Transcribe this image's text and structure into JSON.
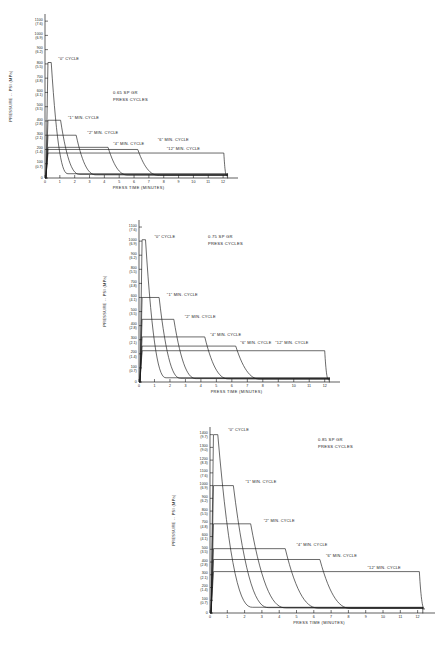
{
  "document": {
    "kind": "engineering-chart-sheet",
    "figure_count": 3
  },
  "shared": {
    "xlabel": "PRESS TIME (MINUTES)",
    "ylabel": "PRESSURE -- PSI (MPa)",
    "x_ticks": [
      "0",
      "1",
      "2",
      "3",
      "4",
      "5",
      "6",
      "7",
      "8",
      "9",
      "10",
      "11",
      "12"
    ],
    "curve_label_0": "\"0\" CYCLE",
    "curve_label_1": "\"1\" MIN. CYCLE",
    "curve_label_2": "\"2\" MIN. CYCLE",
    "curve_label_4": "\"4\" MIN. CYCLE",
    "curve_label_6": "\"6\" MIN. CYCLE",
    "curve_label_12": "\"12\" MIN. CYCLE",
    "ink_color": "#1a1a1a",
    "background_color": "#ffffff"
  },
  "chart_data": [
    {
      "id": "chart-065",
      "type": "line",
      "title": "0.65 SP GR",
      "subtitle": "PRESS CYCLES",
      "xlabel": "PRESS TIME (MINUTES)",
      "ylabel": "PRESSURE -- PSI (MPa)",
      "xlim": [
        0,
        12.6
      ],
      "ylim": [
        0,
        1150
      ],
      "grid": false,
      "legend": "inline-annotations",
      "y_ticks": [
        {
          "psi": 1100,
          "mpa": "7.6"
        },
        {
          "psi": 1000,
          "mpa": "6.9"
        },
        {
          "psi": 900,
          "mpa": "6.2"
        },
        {
          "psi": 800,
          "mpa": "5.5"
        },
        {
          "psi": 700,
          "mpa": "4.8"
        },
        {
          "psi": 600,
          "mpa": "4.1"
        },
        {
          "psi": 500,
          "mpa": "3.5"
        },
        {
          "psi": 400,
          "mpa": "2.8"
        },
        {
          "psi": 300,
          "mpa": "2.1"
        },
        {
          "psi": 200,
          "mpa": "1.4"
        },
        {
          "psi": 100,
          "mpa": "0.7"
        },
        {
          "psi": 0,
          "mpa": ""
        }
      ],
      "x_ticks": [
        0,
        1,
        2,
        3,
        4,
        5,
        6,
        7,
        8,
        9,
        10,
        11,
        12
      ],
      "series": [
        {
          "name": "\"0\" CYCLE",
          "peak_psi": 810,
          "plateau_psi": 810,
          "plateau_end_min": 0.42,
          "decay_end_min": 1.55,
          "tail_psi": 30
        },
        {
          "name": "\"1\" MIN. CYCLE",
          "peak_psi": 405,
          "plateau_psi": 405,
          "plateau_end_min": 1.05,
          "decay_end_min": 2.35,
          "tail_psi": 25
        },
        {
          "name": "\"2\" MIN. CYCLE",
          "peak_psi": 300,
          "plateau_psi": 300,
          "plateau_end_min": 2.1,
          "decay_end_min": 3.45,
          "tail_psi": 22
        },
        {
          "name": "\"4\" MIN. CYCLE",
          "peak_psi": 215,
          "plateau_psi": 215,
          "plateau_end_min": 4.25,
          "decay_end_min": 5.6,
          "tail_psi": 20
        },
        {
          "name": "\"6\" MIN. CYCLE",
          "peak_psi": 200,
          "plateau_psi": 200,
          "plateau_end_min": 6.25,
          "decay_end_min": 7.7,
          "tail_psi": 18
        },
        {
          "name": "\"12\" MIN. CYCLE",
          "peak_psi": 175,
          "plateau_psi": 175,
          "plateau_end_min": 12.05,
          "decay_end_min": 12.25,
          "tail_psi": 15
        }
      ],
      "annotations": [
        {
          "text": "\"0\" CYCLE",
          "x_min": 0.9,
          "psi": 830
        },
        {
          "text": "\"1\" MIN. CYCLE",
          "x_min": 1.55,
          "psi": 415
        },
        {
          "text": "\"2\" MIN. CYCLE",
          "x_min": 2.85,
          "psi": 310
        },
        {
          "text": "\"4\" MIN. CYCLE",
          "x_min": 4.6,
          "psi": 228
        },
        {
          "text": "\"6\" MIN. CYCLE",
          "x_min": 7.6,
          "psi": 258
        },
        {
          "text": "\"12\" MIN. CYCLE",
          "x_min": 8.2,
          "psi": 195
        }
      ]
    },
    {
      "id": "chart-075",
      "type": "line",
      "title": "0.75 SP GR",
      "subtitle": "PRESS CYCLES",
      "xlabel": "PRESS TIME (MINUTES)",
      "ylabel": "PRESSURE -- PSI (MPa)",
      "xlim": [
        0,
        12.6
      ],
      "ylim": [
        0,
        1150
      ],
      "grid": false,
      "legend": "inline-annotations",
      "y_ticks": [
        {
          "psi": 1100,
          "mpa": "7.6"
        },
        {
          "psi": 1000,
          "mpa": "6.9"
        },
        {
          "psi": 900,
          "mpa": "6.2"
        },
        {
          "psi": 800,
          "mpa": "5.5"
        },
        {
          "psi": 700,
          "mpa": "4.8"
        },
        {
          "psi": 600,
          "mpa": "4.1"
        },
        {
          "psi": 500,
          "mpa": "3.5"
        },
        {
          "psi": 400,
          "mpa": "2.8"
        },
        {
          "psi": 300,
          "mpa": "2.1"
        },
        {
          "psi": 200,
          "mpa": "1.4"
        },
        {
          "psi": 100,
          "mpa": "0.7"
        },
        {
          "psi": 0,
          "mpa": ""
        }
      ],
      "x_ticks": [
        0,
        1,
        2,
        3,
        4,
        5,
        6,
        7,
        8,
        9,
        10,
        11,
        12
      ],
      "series": [
        {
          "name": "\"0\" CYCLE",
          "peak_psi": 1010,
          "plateau_psi": 1010,
          "plateau_end_min": 0.42,
          "decay_end_min": 1.75,
          "tail_psi": 30
        },
        {
          "name": "\"1\" MIN. CYCLE",
          "peak_psi": 600,
          "plateau_psi": 600,
          "plateau_end_min": 1.3,
          "decay_end_min": 2.7,
          "tail_psi": 26
        },
        {
          "name": "\"2\" MIN. CYCLE",
          "peak_psi": 445,
          "plateau_psi": 445,
          "plateau_end_min": 2.25,
          "decay_end_min": 3.7,
          "tail_psi": 24
        },
        {
          "name": "\"4\" MIN. CYCLE",
          "peak_psi": 320,
          "plateau_psi": 320,
          "plateau_end_min": 4.25,
          "decay_end_min": 5.8,
          "tail_psi": 22
        },
        {
          "name": "\"6\" MIN. CYCLE",
          "peak_psi": 255,
          "plateau_psi": 255,
          "plateau_end_min": 6.25,
          "decay_end_min": 7.85,
          "tail_psi": 20
        },
        {
          "name": "\"12\" MIN. CYCLE",
          "peak_psi": 222,
          "plateau_psi": 222,
          "plateau_end_min": 12.0,
          "decay_end_min": 12.25,
          "tail_psi": 16
        }
      ],
      "annotations": [
        {
          "text": "\"0\" CYCLE",
          "x_min": 1.0,
          "psi": 1025
        },
        {
          "text": "\"1\" MIN. CYCLE",
          "x_min": 1.8,
          "psi": 612
        },
        {
          "text": "\"2\" MIN. CYCLE",
          "x_min": 2.95,
          "psi": 455
        },
        {
          "text": "\"4\" MIN. CYCLE",
          "x_min": 4.6,
          "psi": 330
        },
        {
          "text": "\"6\" MIN. CYCLE",
          "x_min": 6.55,
          "psi": 272
        },
        {
          "text": "\"12\" MIN. CYCLE",
          "x_min": 8.8,
          "psi": 272
        }
      ]
    },
    {
      "id": "chart-085",
      "type": "line",
      "title": "0.85 SP GR",
      "subtitle": "PRESS CYCLES",
      "xlabel": "PRESS TIME (MINUTES)",
      "ylabel": "PRESSURE -- PSI (MPa)",
      "xlim": [
        0,
        12.6
      ],
      "ylim": [
        0,
        1460
      ],
      "grid": false,
      "legend": "inline-annotations",
      "y_ticks": [
        {
          "psi": 1400,
          "mpa": "9.7"
        },
        {
          "psi": 1300,
          "mpa": "9.0"
        },
        {
          "psi": 1200,
          "mpa": "8.3"
        },
        {
          "psi": 1100,
          "mpa": "7.6"
        },
        {
          "psi": 1000,
          "mpa": "6.9"
        },
        {
          "psi": 900,
          "mpa": "6.2"
        },
        {
          "psi": 800,
          "mpa": "5.5"
        },
        {
          "psi": 700,
          "mpa": "4.8"
        },
        {
          "psi": 600,
          "mpa": "4.1"
        },
        {
          "psi": 500,
          "mpa": "3.5"
        },
        {
          "psi": 400,
          "mpa": "2.8"
        },
        {
          "psi": 300,
          "mpa": "2.1"
        },
        {
          "psi": 200,
          "mpa": "1.4"
        },
        {
          "psi": 100,
          "mpa": "0.7"
        },
        {
          "psi": 0,
          "mpa": ""
        }
      ],
      "x_ticks": [
        0,
        1,
        2,
        3,
        4,
        5,
        6,
        7,
        8,
        9,
        10,
        11,
        12
      ],
      "series": [
        {
          "name": "\"0\" CYCLE",
          "peak_psi": 1400,
          "plateau_psi": 1400,
          "plateau_end_min": 0.45,
          "decay_end_min": 2.45,
          "tail_psi": 45
        },
        {
          "name": "\"1\" MIN. CYCLE",
          "peak_psi": 1000,
          "plateau_psi": 1000,
          "plateau_end_min": 1.35,
          "decay_end_min": 3.4,
          "tail_psi": 42
        },
        {
          "name": "\"2\" MIN. CYCLE",
          "peak_psi": 700,
          "plateau_psi": 700,
          "plateau_end_min": 2.35,
          "decay_end_min": 4.4,
          "tail_psi": 40
        },
        {
          "name": "\"4\" MIN. CYCLE",
          "peak_psi": 505,
          "plateau_psi": 505,
          "plateau_end_min": 4.35,
          "decay_end_min": 6.3,
          "tail_psi": 38
        },
        {
          "name": "\"6\" MIN. CYCLE",
          "peak_psi": 420,
          "plateau_psi": 420,
          "plateau_end_min": 6.35,
          "decay_end_min": 8.15,
          "tail_psi": 36
        },
        {
          "name": "\"12\" MIN. CYCLE",
          "peak_psi": 325,
          "plateau_psi": 325,
          "plateau_end_min": 12.1,
          "decay_end_min": 12.4,
          "tail_psi": 32
        }
      ],
      "annotations": [
        {
          "text": "\"0\" CYCLE",
          "x_min": 1.05,
          "psi": 1430
        },
        {
          "text": "\"1\" MIN. CYCLE",
          "x_min": 2.05,
          "psi": 1022
        },
        {
          "text": "\"2\" MIN. CYCLE",
          "x_min": 3.1,
          "psi": 718
        },
        {
          "text": "\"4\" MIN. CYCLE",
          "x_min": 5.0,
          "psi": 522
        },
        {
          "text": "\"6\" MIN. CYCLE",
          "x_min": 6.7,
          "psi": 438
        },
        {
          "text": "\"12\" MIN. CYCLE",
          "x_min": 9.1,
          "psi": 348
        }
      ]
    }
  ]
}
